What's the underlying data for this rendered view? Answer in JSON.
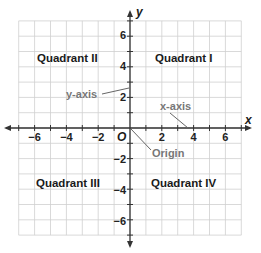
{
  "diagram": {
    "type": "coordinate-plane",
    "grid": {
      "min": -7,
      "max": 7,
      "step": 1,
      "color": "#c8c8c8"
    },
    "axes": {
      "x": {
        "label": "x",
        "ticks": [
          -6,
          -4,
          -2,
          2,
          4,
          6
        ],
        "tick_labels": [
          "−6",
          "−4",
          "−2",
          "2",
          "4",
          "6"
        ]
      },
      "y": {
        "label": "y",
        "ticks": [
          6,
          4,
          2,
          -2,
          -4,
          -6
        ],
        "tick_labels": [
          "6",
          "4",
          "2",
          "−2",
          "−4",
          "−6"
        ]
      },
      "color": "#333333"
    },
    "origin_label": "O",
    "quadrants": {
      "q1": "Quadrant I",
      "q2": "Quadrant II",
      "q3": "Quadrant III",
      "q4": "Quadrant IV"
    },
    "callouts": {
      "y_axis": "y-axis",
      "x_axis": "x-axis",
      "origin": "Origin",
      "color": "#777777"
    }
  }
}
